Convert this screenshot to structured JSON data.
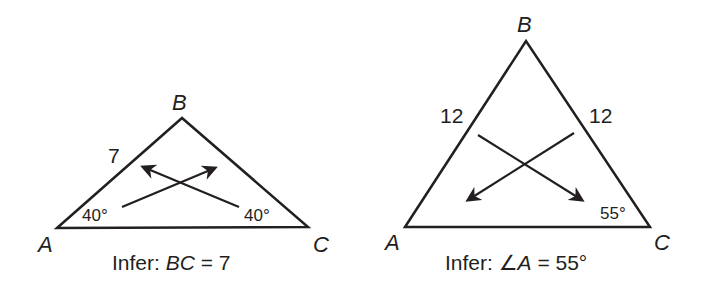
{
  "colors": {
    "stroke": "#231f20",
    "background": "#ffffff"
  },
  "figures": [
    {
      "id": "left-triangle",
      "vertices": {
        "A": {
          "label": "A",
          "x": 57,
          "y": 228
        },
        "B": {
          "label": "B",
          "x": 182,
          "y": 118
        },
        "C": {
          "label": "C",
          "x": 308,
          "y": 227
        }
      },
      "side_labels": [
        {
          "text": "7",
          "side": "AB"
        }
      ],
      "angle_labels": [
        {
          "text": "40°",
          "vertex": "A"
        },
        {
          "text": "40°",
          "vertex": "C"
        }
      ],
      "arrows": [
        {
          "from": "angle A",
          "to": "side BC"
        },
        {
          "from": "angle C",
          "to": "side AB"
        }
      ],
      "caption": {
        "prefix": "Infer: ",
        "subject": "BC",
        "rest": " = 7"
      }
    },
    {
      "id": "right-triangle",
      "vertices": {
        "A": {
          "label": "A",
          "x": 405,
          "y": 227
        },
        "B": {
          "label": "B",
          "x": 526,
          "y": 41
        },
        "C": {
          "label": "C",
          "x": 650,
          "y": 227
        }
      },
      "side_labels": [
        {
          "text": "12",
          "side": "AB"
        },
        {
          "text": "12",
          "side": "BC"
        }
      ],
      "angle_labels": [
        {
          "text": "55°",
          "vertex": "C"
        }
      ],
      "arrows": [
        {
          "from": "side AB",
          "to": "angle C"
        },
        {
          "from": "side BC",
          "to": "angle A"
        }
      ],
      "caption": {
        "prefix": "Infer: ",
        "angle_symbol": "∠",
        "subject": "A",
        "rest": " = 55°"
      }
    }
  ]
}
